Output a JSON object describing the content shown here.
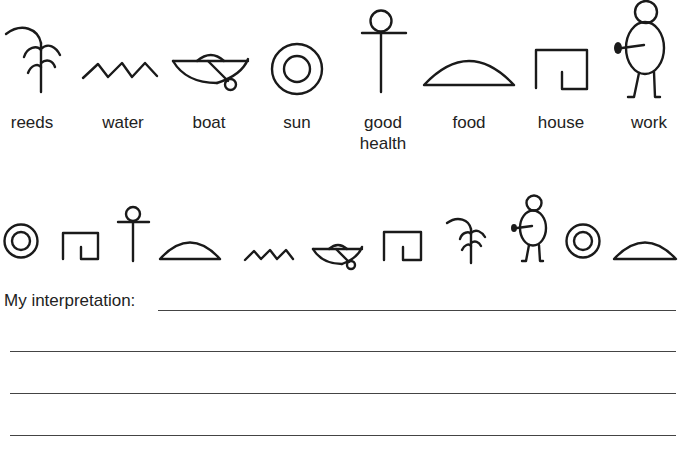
{
  "legend": {
    "title": "",
    "symbols": [
      {
        "id": "reeds",
        "label": "reeds",
        "icon": "reeds-icon"
      },
      {
        "id": "water",
        "label": "water",
        "icon": "water-icon"
      },
      {
        "id": "boat",
        "label": "boat",
        "icon": "boat-icon"
      },
      {
        "id": "sun",
        "label": "sun",
        "icon": "sun-icon"
      },
      {
        "id": "good-health",
        "label_line1": "good",
        "label_line2": "health",
        "icon": "good-health-icon"
      },
      {
        "id": "food",
        "label": "food",
        "icon": "food-icon"
      },
      {
        "id": "house",
        "label": "house",
        "icon": "house-icon"
      },
      {
        "id": "work",
        "label": "work",
        "icon": "work-icon"
      }
    ]
  },
  "message": {
    "sequence": [
      "sun",
      "house",
      "good-health",
      "food",
      "water",
      "boat",
      "house",
      "reeds",
      "work",
      "sun",
      "food"
    ]
  },
  "worksheet": {
    "prompt": "My interpretation:",
    "answer_lines": 4,
    "answer_values": [
      "",
      "",
      "",
      ""
    ]
  }
}
